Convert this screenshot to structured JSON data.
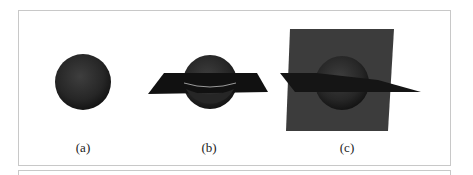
{
  "figure": {
    "panels": [
      {
        "label": "(a)",
        "description": "sphere"
      },
      {
        "label": "(b)",
        "description": "sphere with horizontal plane"
      },
      {
        "label": "(c)",
        "description": "sphere with horizontal and vertical planes"
      }
    ],
    "colors": {
      "sphere": "#2a2a2a",
      "horizontal_plane": "#111111",
      "vertical_plane": "#3c3c3c",
      "intersection_ring": "#9a9a9a",
      "frame_border": "#c8c8c8"
    }
  }
}
